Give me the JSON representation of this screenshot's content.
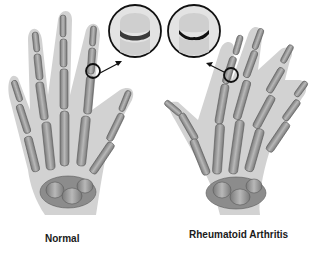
{
  "figure": {
    "type": "medical-illustration",
    "panels": [
      {
        "id": "normal",
        "label": "Normal",
        "hand": "left-hand-palm-view-skeleton",
        "inset": {
          "description": "magnified healthy finger joint with normal joint space",
          "joint_space": "thick smooth cartilage gap"
        }
      },
      {
        "id": "rheumatoid-arthritis",
        "label": "Rheumatoid Arthritis",
        "hand": "right-hand-skeleton-with-ulnar-deviation",
        "inset": {
          "description": "magnified finger joint with eroded, narrowed joint space",
          "joint_space": "narrowed irregular dark gap"
        }
      }
    ],
    "colors": {
      "skin_silhouette": "#cfcfcf",
      "bone": "#a8a8a8",
      "bone_dark": "#6e6e6e",
      "outline": "#111111",
      "background": "#ffffff"
    }
  }
}
